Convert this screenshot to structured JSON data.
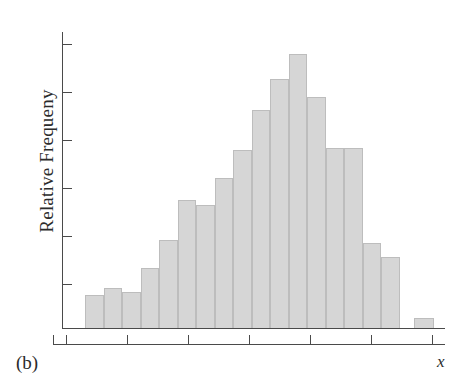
{
  "figure": {
    "panel_label": "(b)",
    "axis_color": "#4a4a4a",
    "bar_fill_color": "#d6d6d6",
    "bar_border_color": "#bdbdbd",
    "background_color": "#ffffff"
  },
  "chart_data": {
    "type": "bar",
    "title": "",
    "subtitle": "",
    "xlabel": "x",
    "ylabel": "Relative Frequeny",
    "annotations": [
      "(b)"
    ],
    "grid": false,
    "legend": null,
    "axis_tick_labels": {
      "x": [],
      "y": []
    },
    "y_tick_count": 6,
    "x_tick_count": 7,
    "ylim": [
      0,
      1
    ],
    "xlim": [
      0,
      20
    ],
    "note": "Unlabeled bell-shaped relative-frequency histogram with one isolated outlier bar at the far right.",
    "categories": [
      "bin-1",
      "bin-2",
      "bin-3",
      "bin-4",
      "bin-5",
      "bin-6",
      "bin-7",
      "bin-8",
      "bin-9",
      "bin-10",
      "bin-11",
      "bin-12",
      "bin-13",
      "bin-14",
      "bin-15",
      "bin-16",
      "bin-17",
      "bin-18",
      "bin-19"
    ],
    "values": [
      0.111,
      0.135,
      0.121,
      0.202,
      0.296,
      0.431,
      0.414,
      0.505,
      0.6,
      0.734,
      0.838,
      0.923,
      0.778,
      0.606,
      0.606,
      0.286,
      0.239,
      0.0,
      0.034
    ],
    "bars": [
      {
        "name": "bin-1",
        "x": 85,
        "width": 19,
        "height_px": 33,
        "value": 0.111
      },
      {
        "name": "bin-2",
        "x": 104,
        "width": 18,
        "height_px": 40,
        "value": 0.135
      },
      {
        "name": "bin-3",
        "x": 122,
        "width": 19,
        "height_px": 36,
        "value": 0.121
      },
      {
        "name": "bin-4",
        "x": 141,
        "width": 18,
        "height_px": 60,
        "value": 0.202
      },
      {
        "name": "bin-5",
        "x": 159,
        "width": 19,
        "height_px": 88,
        "value": 0.296
      },
      {
        "name": "bin-6",
        "x": 178,
        "width": 18,
        "height_px": 128,
        "value": 0.431
      },
      {
        "name": "bin-7",
        "x": 196,
        "width": 19,
        "height_px": 123,
        "value": 0.414
      },
      {
        "name": "bin-8",
        "x": 215,
        "width": 18,
        "height_px": 150,
        "value": 0.505
      },
      {
        "name": "bin-9",
        "x": 233,
        "width": 19,
        "height_px": 178,
        "value": 0.6
      },
      {
        "name": "bin-10",
        "x": 252,
        "width": 18,
        "height_px": 218,
        "value": 0.734
      },
      {
        "name": "bin-11",
        "x": 270,
        "width": 19,
        "height_px": 249,
        "value": 0.838
      },
      {
        "name": "bin-12",
        "x": 289,
        "width": 18,
        "height_px": 274,
        "value": 0.923
      },
      {
        "name": "bin-13",
        "x": 307,
        "width": 19,
        "height_px": 231,
        "value": 0.778
      },
      {
        "name": "bin-14",
        "x": 326,
        "width": 18,
        "height_px": 180,
        "value": 0.606
      },
      {
        "name": "bin-15",
        "x": 344,
        "width": 19,
        "height_px": 180,
        "value": 0.606
      },
      {
        "name": "bin-16",
        "x": 363,
        "width": 18,
        "height_px": 85,
        "value": 0.286
      },
      {
        "name": "bin-17",
        "x": 381,
        "width": 19,
        "height_px": 71,
        "value": 0.239
      },
      {
        "name": "bin-19",
        "x": 414,
        "width": 20,
        "height_px": 10,
        "value": 0.034
      }
    ],
    "y_ticks_px": [
      44,
      92,
      140,
      188,
      236,
      284
    ],
    "x_ticks_px": [
      66,
      127,
      188,
      249,
      310,
      371,
      432
    ]
  }
}
